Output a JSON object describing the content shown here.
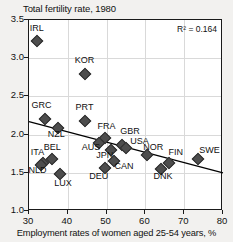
{
  "chart_data": {
    "type": "scatter",
    "title": "Total fertility rate, 1980",
    "ylabel": "Total fertility rate, 1980",
    "xlabel": "Employment rates of women aged 25-54 years, %",
    "xlim": [
      30,
      80
    ],
    "ylim": [
      1.0,
      3.5
    ],
    "xticks": [
      "30",
      "40",
      "50",
      "60",
      "70",
      "80"
    ],
    "yticks": [
      "1.0",
      "1.5",
      "2.0",
      "2.5",
      "3.0",
      "3.5"
    ],
    "grid": true,
    "legend": "none",
    "annotation": "R² = 0.164",
    "r_squared": 0.164,
    "marker_color": "#4d4d4d",
    "trendline": {
      "x": [
        30,
        80
      ],
      "y": [
        2.17,
        1.5
      ],
      "color": "#000000"
    },
    "points": [
      {
        "label": "IRL",
        "x": 32.0,
        "y": 3.23,
        "lx": 32.0,
        "ly": 3.38,
        "anchor": "center"
      },
      {
        "label": "KOR",
        "x": 44.5,
        "y": 2.79,
        "lx": 44.3,
        "ly": 2.96,
        "anchor": "center"
      },
      {
        "label": "GRC",
        "x": 34.0,
        "y": 2.21,
        "lx": 33.2,
        "ly": 2.38,
        "anchor": "center"
      },
      {
        "label": "PRT",
        "x": 44.5,
        "y": 2.18,
        "lx": 44.3,
        "ly": 2.35,
        "anchor": "center"
      },
      {
        "label": "NZL",
        "x": 37.5,
        "y": 2.09,
        "lx": 37.0,
        "ly": 1.99,
        "anchor": "center"
      },
      {
        "label": "FRA",
        "x": 49.5,
        "y": 1.95,
        "lx": 50.0,
        "ly": 2.1,
        "anchor": "center"
      },
      {
        "label": "AUS",
        "x": 48.0,
        "y": 1.89,
        "lx": 46.0,
        "ly": 1.82,
        "anchor": "center"
      },
      {
        "label": "GBR",
        "x": 54.0,
        "y": 1.87,
        "lx": 56.0,
        "ly": 2.04,
        "anchor": "center"
      },
      {
        "label": "USA",
        "x": 55.0,
        "y": 1.83,
        "lx": 58.5,
        "ly": 1.91,
        "anchor": "center"
      },
      {
        "label": "JPN",
        "x": 51.0,
        "y": 1.8,
        "lx": 49.5,
        "ly": 1.72,
        "anchor": "center"
      },
      {
        "label": "BEL",
        "x": 36.0,
        "y": 1.68,
        "lx": 36.0,
        "ly": 1.83,
        "anchor": "center"
      },
      {
        "label": "ITA",
        "x": 33.6,
        "y": 1.63,
        "lx": 32.2,
        "ly": 1.76,
        "anchor": "center"
      },
      {
        "label": "NLD",
        "x": 33.0,
        "y": 1.6,
        "lx": 32.2,
        "ly": 1.52,
        "anchor": "center"
      },
      {
        "label": "NOR",
        "x": 60.5,
        "y": 1.73,
        "lx": 62.0,
        "ly": 1.83,
        "anchor": "center"
      },
      {
        "label": "SWE",
        "x": 73.5,
        "y": 1.68,
        "lx": 76.5,
        "ly": 1.78,
        "anchor": "center"
      },
      {
        "label": "FIN",
        "x": 66.0,
        "y": 1.63,
        "lx": 67.8,
        "ly": 1.76,
        "anchor": "center"
      },
      {
        "label": "CAN",
        "x": 52.0,
        "y": 1.65,
        "lx": 54.5,
        "ly": 1.58,
        "anchor": "center"
      },
      {
        "label": "DEU",
        "x": 49.5,
        "y": 1.56,
        "lx": 48.0,
        "ly": 1.45,
        "anchor": "center"
      },
      {
        "label": "DNK",
        "x": 64.0,
        "y": 1.55,
        "lx": 64.5,
        "ly": 1.44,
        "anchor": "center"
      },
      {
        "label": "LUX",
        "x": 38.0,
        "y": 1.49,
        "lx": 38.8,
        "ly": 1.36,
        "anchor": "center"
      }
    ]
  }
}
